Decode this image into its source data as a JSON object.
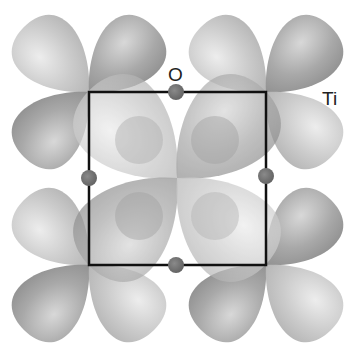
{
  "diagram": {
    "type": "orbital-lattice",
    "labels": {
      "oxygen": "O",
      "titanium": "Ti"
    },
    "colors": {
      "lobe_dark": "#8e8e8e",
      "lobe_light": "#c4c4c4",
      "atom_o": "#6a6a6a",
      "bond": "#111111",
      "background": "#ffffff"
    },
    "ti_sites": [
      [
        89,
        92
      ],
      [
        266,
        92
      ],
      [
        89,
        265
      ],
      [
        266,
        265
      ]
    ],
    "o_sites": [
      [
        176,
        92
      ],
      [
        89,
        178
      ],
      [
        266,
        176
      ],
      [
        176,
        265
      ]
    ]
  }
}
